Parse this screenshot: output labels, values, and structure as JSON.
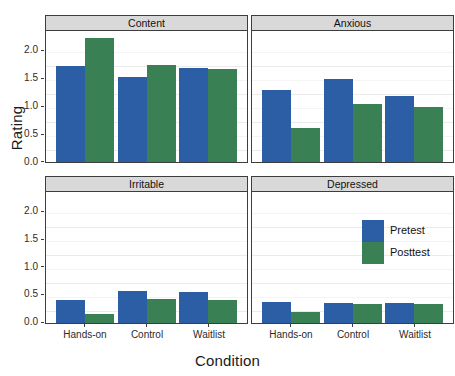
{
  "chart_data": {
    "type": "bar",
    "title": "",
    "xlabel": "Condition",
    "ylabel": "Rating",
    "categories": [
      "Hands-on",
      "Control",
      "Waitlist"
    ],
    "ylim": [
      0,
      2.25
    ],
    "yticks": [
      0.0,
      0.5,
      1.0,
      1.5,
      2.0
    ],
    "ytick_labels": [
      "0.0",
      "0.5",
      "1.0",
      "1.5",
      "2.0"
    ],
    "grid": true,
    "legend": {
      "position": "inside-bottom-right-panel",
      "entries": [
        {
          "label": "Pretest",
          "color": "#2c5ea6"
        },
        {
          "label": "Posttest",
          "color": "#3a8055"
        }
      ]
    },
    "series": [
      {
        "name": "Pretest",
        "color": "#2c5ea6"
      },
      {
        "name": "Posttest",
        "color": "#3a8055"
      }
    ],
    "facets": [
      {
        "label": "Content",
        "values": {
          "Pretest": [
            1.65,
            1.46,
            1.62
          ],
          "Posttest": [
            2.13,
            1.67,
            1.6
          ]
        }
      },
      {
        "label": "Anxious",
        "values": {
          "Pretest": [
            1.23,
            1.42,
            1.14
          ],
          "Posttest": [
            0.58,
            1.0,
            0.95
          ]
        }
      },
      {
        "label": "Irritable",
        "values": {
          "Pretest": [
            0.4,
            0.55,
            0.53
          ],
          "Posttest": [
            0.16,
            0.41,
            0.4
          ]
        }
      },
      {
        "label": "Depressed",
        "values": {
          "Pretest": [
            0.36,
            0.34,
            0.35
          ],
          "Posttest": [
            0.19,
            0.33,
            0.32
          ]
        }
      }
    ]
  },
  "axes": {
    "y_title": "Rating",
    "x_title": "Condition",
    "y_tick_labels": [
      "2.0",
      "1.5",
      "1.0",
      "0.5",
      "0.0"
    ],
    "x_tick_labels": [
      "Hands-on",
      "Control",
      "Waitlist"
    ]
  },
  "facet_strips": [
    "Content",
    "Anxious",
    "Irritable",
    "Depressed"
  ],
  "legend_labels": [
    "Pretest",
    "Posttest"
  ],
  "colors": {
    "pretest": "#2c5ea6",
    "posttest": "#3a8055",
    "strip_background": "#d9d9d9",
    "panel_border": "#3d3d3d",
    "gridline": "#ebebeb"
  }
}
